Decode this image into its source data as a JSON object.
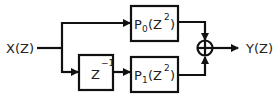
{
  "diagram": {
    "input_label": "X(Z)",
    "output_label": "Y(Z)",
    "delay_block": {
      "base": "Z",
      "exponent": "−1"
    },
    "filter_top": {
      "name": "P",
      "sub": "0",
      "arg_base": "(Z",
      "arg_exp": "2",
      "close": ")"
    },
    "filter_bottom": {
      "name": "P",
      "sub": "1",
      "arg_base": "(Z",
      "arg_exp": "2",
      "close": ")"
    },
    "summer": "adder-circle-plus-icon",
    "colors": {
      "stroke": "#111111",
      "background": "#ffffff",
      "text": "#222222"
    }
  }
}
